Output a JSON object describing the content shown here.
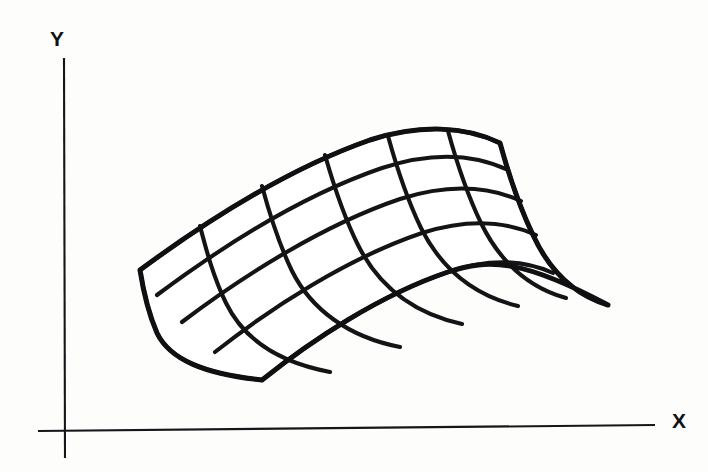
{
  "figure": {
    "background_color": "#fdfdfc",
    "ink_color": "#141417",
    "width": 708,
    "height": 472
  },
  "axes": {
    "x_axis": {
      "label": "X",
      "label_x": 672,
      "label_y": 428,
      "line_x1": 38,
      "line_y1": 431,
      "line_x2": 655,
      "line_y2": 425
    },
    "y_axis": {
      "label": "Y",
      "label_x": 50,
      "label_y": 46,
      "line_x1": 64,
      "line_y1": 58,
      "line_x2": 65,
      "line_y2": 458
    }
  },
  "chart_data": {
    "type": "mesh-surface",
    "xlabel": "X",
    "ylabel": "Y",
    "grid": {
      "columns": 6,
      "rows": 4
    },
    "corners": {
      "left": [
        140,
        270
      ],
      "bottom": [
        262,
        380
      ],
      "right": [
        500,
        215
      ],
      "top": [
        370,
        128
      ]
    },
    "u_curves": [
      "M 140,270 C 205,222 290,168 370,140 C 420,124 465,126 500,143",
      "M 157,295 C 220,248 303,195 382,168 C 431,152 474,154 508,170",
      "M 182,322 C 243,276 323,225 400,199 C 447,184 488,186 521,201",
      "M 215,352 C 272,307 348,258 422,233 C 466,219 505,221 536,235",
      "M 262,380 C 312,340 380,295 448,272 C 489,258 524,260 553,273"
    ],
    "v_curves": [
      "M 140,270 C 143,289 147,310 157,333 C 170,360 205,374 262,380",
      "M 200,226 C 206,249 213,276 226,303 C 243,338 277,362 330,372",
      "M 262,186 C 269,212 278,242 292,271 C 311,309 348,337 400,347",
      "M 325,155 C 333,183 343,215 358,245 C 378,285 412,313 462,324",
      "M 388,136 C 396,165 406,197 421,228 C 441,268 472,295 518,306",
      "M 448,131 C 456,160 466,192 481,223 C 500,262 527,287 566,298",
      "M 500,143 C 508,172 518,204 533,235 C 550,272 575,295 608,305"
    ]
  }
}
